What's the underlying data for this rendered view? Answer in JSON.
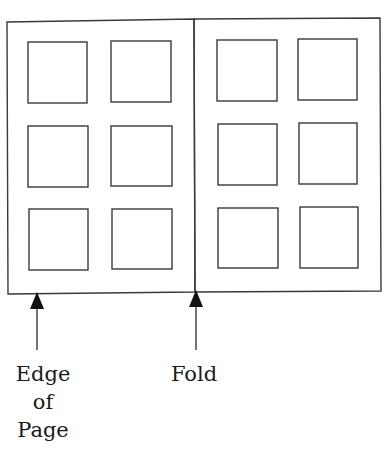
{
  "diagram": {
    "type": "page-spread-layout",
    "stroke_color": "#3a3a3a",
    "pages": [
      {
        "name": "left-page",
        "grid": {
          "rows": 3,
          "cols": 2
        }
      },
      {
        "name": "right-page",
        "grid": {
          "rows": 3,
          "cols": 2
        }
      }
    ],
    "annotations": [
      {
        "name": "edge-of-page",
        "lines": [
          "Edge",
          "of",
          "Page"
        ]
      },
      {
        "name": "fold",
        "lines": [
          "Fold"
        ]
      }
    ]
  },
  "labels": {
    "edge_line1": "Edge",
    "edge_line2": "of",
    "edge_line3": "Page",
    "fold": "Fold"
  }
}
